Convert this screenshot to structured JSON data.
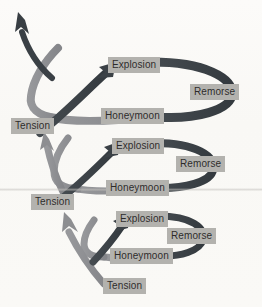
{
  "diagram": {
    "colors": {
      "background": "#fbfaf8",
      "label_box": "#b3b2ae",
      "label_text": "#2c2b2a",
      "arc_dark": "#3d4449",
      "arc_gray": "#8f9093",
      "escape_arrow": "#3a4045"
    },
    "cycles": [
      {
        "index": 3,
        "size": "largest",
        "nodes": {
          "tension": "Tension",
          "explosion": "Explosion",
          "remorse": "Remorse",
          "honeymoon": "Honeymoon"
        }
      },
      {
        "index": 2,
        "size": "medium",
        "nodes": {
          "tension": "Tension",
          "explosion": "Explosion",
          "remorse": "Remorse",
          "honeymoon": "Honeymoon"
        }
      },
      {
        "index": 1,
        "size": "smallest",
        "nodes": {
          "tension": "Tension",
          "explosion": "Explosion",
          "remorse": "Remorse",
          "honeymoon": "Honeymoon"
        }
      }
    ],
    "escape_arrow": {
      "name": "escalation-exit-arrow",
      "direction": "up-left"
    }
  }
}
